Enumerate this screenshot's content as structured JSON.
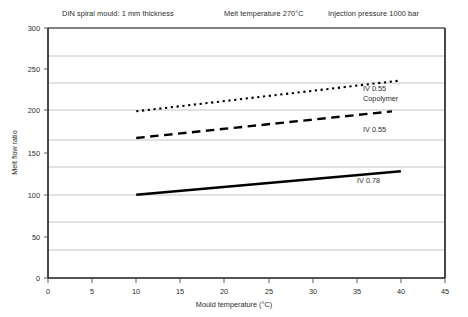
{
  "header": {
    "notes": [
      "DIN spiral mould: 1 mm thickness",
      "Melt temperature 270°C",
      "Injection pressure 1000 bar"
    ]
  },
  "chart_data": {
    "type": "line",
    "title": "",
    "xlabel": "Mould temperature (°C)",
    "ylabel": "Melt flow ratio",
    "xlim": [
      0,
      45
    ],
    "ylim": [
      0,
      300
    ],
    "xticks": [
      0,
      5,
      10,
      15,
      20,
      25,
      30,
      35,
      40,
      45
    ],
    "yticks": [
      0,
      50,
      100,
      150,
      200,
      250,
      300
    ],
    "grid": "horizontal",
    "legend_position": "inline-right",
    "series": [
      {
        "name": "IV 0.55 Copolymer",
        "label_lines": [
          "IV 0.55",
          "Copolymer"
        ],
        "style": "dotted",
        "color": "#000000",
        "x": [
          10,
          40
        ],
        "y": [
          200,
          237
        ]
      },
      {
        "name": "IV 0.55",
        "label_lines": [
          "IV 0.55"
        ],
        "style": "dashed",
        "color": "#000000",
        "x": [
          10,
          39
        ],
        "y": [
          168,
          200
        ]
      },
      {
        "name": "IV 0.78",
        "label_lines": [
          "IV 0.78"
        ],
        "style": "solid",
        "color": "#000000",
        "x": [
          10,
          40
        ],
        "y": [
          100,
          128
        ]
      }
    ]
  },
  "axis": {
    "y_tick_labels": [
      "300",
      "250",
      "200",
      "150",
      "100",
      "50",
      "0"
    ],
    "x_tick_labels": [
      "0",
      "5",
      "10",
      "15",
      "20",
      "25",
      "30",
      "35",
      "40",
      "45"
    ]
  }
}
